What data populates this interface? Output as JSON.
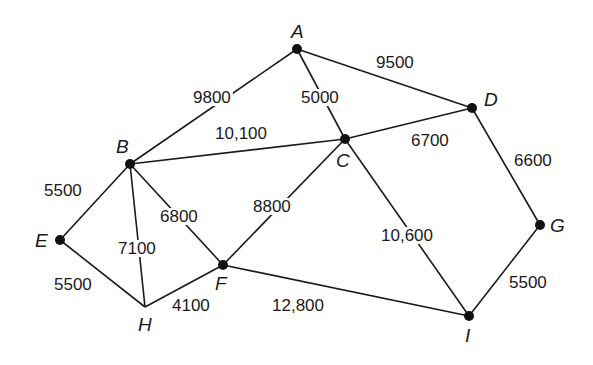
{
  "diagram": {
    "type": "weighted-undirected-graph",
    "nodes": [
      {
        "id": "A",
        "x": 297,
        "y": 49,
        "label_x": 291,
        "label_y": 38,
        "dot": true
      },
      {
        "id": "B",
        "x": 130,
        "y": 164,
        "label_x": 116,
        "label_y": 153,
        "dot": true
      },
      {
        "id": "C",
        "x": 345,
        "y": 139,
        "label_x": 336,
        "label_y": 167,
        "dot": true
      },
      {
        "id": "D",
        "x": 472,
        "y": 108,
        "label_x": 484,
        "label_y": 106,
        "dot": true
      },
      {
        "id": "E",
        "x": 60,
        "y": 240,
        "label_x": 35,
        "label_y": 247,
        "dot": true
      },
      {
        "id": "F",
        "x": 223,
        "y": 265,
        "label_x": 215,
        "label_y": 290,
        "dot": true
      },
      {
        "id": "G",
        "x": 540,
        "y": 225,
        "label_x": 550,
        "label_y": 232,
        "dot": true
      },
      {
        "id": "H",
        "x": 145,
        "y": 307,
        "label_x": 138,
        "label_y": 331,
        "dot": false
      },
      {
        "id": "I",
        "x": 469,
        "y": 316,
        "label_x": 465,
        "label_y": 342,
        "dot": true
      }
    ],
    "edges": [
      {
        "from": "A",
        "to": "B",
        "weight": "9800",
        "label_x": 193,
        "label_y": 103
      },
      {
        "from": "A",
        "to": "D",
        "weight": "9500",
        "label_x": 376,
        "label_y": 68
      },
      {
        "from": "A",
        "to": "C",
        "weight": "5000",
        "label_x": 301,
        "label_y": 103
      },
      {
        "from": "B",
        "to": "C",
        "weight": "10,100",
        "label_x": 215,
        "label_y": 139
      },
      {
        "from": "C",
        "to": "D",
        "weight": "6700",
        "label_x": 411,
        "label_y": 146
      },
      {
        "from": "D",
        "to": "G",
        "weight": "6600",
        "label_x": 514,
        "label_y": 166
      },
      {
        "from": "B",
        "to": "E",
        "weight": "5500",
        "label_x": 44,
        "label_y": 196
      },
      {
        "from": "B",
        "to": "H",
        "weight": "7100",
        "label_x": 118,
        "label_y": 254
      },
      {
        "from": "B",
        "to": "F",
        "weight": "6800",
        "label_x": 160,
        "label_y": 222
      },
      {
        "from": "C",
        "to": "F",
        "weight": "8800",
        "label_x": 253,
        "label_y": 212
      },
      {
        "from": "C",
        "to": "I",
        "weight": "10,600",
        "label_x": 381,
        "label_y": 241
      },
      {
        "from": "E",
        "to": "H",
        "weight": "5500",
        "label_x": 54,
        "label_y": 290
      },
      {
        "from": "H",
        "to": "F",
        "weight": "4100",
        "label_x": 172,
        "label_y": 311
      },
      {
        "from": "F",
        "to": "I",
        "weight": "12,800",
        "label_x": 272,
        "label_y": 311
      },
      {
        "from": "G",
        "to": "I",
        "weight": "5500",
        "label_x": 509,
        "label_y": 288
      }
    ]
  },
  "colors": {
    "background": "#ffffff",
    "line": "#1a1a1a",
    "node": "#111111"
  }
}
